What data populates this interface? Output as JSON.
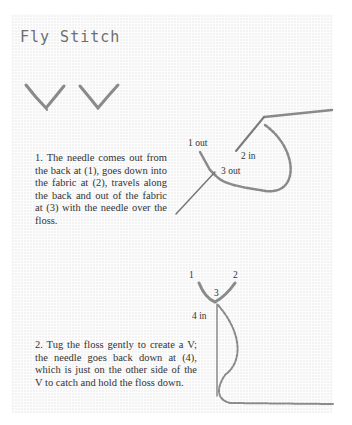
{
  "title": "Fly Stitch",
  "steps": [
    {
      "text": "1. The needle comes out from the back at (1), goes down into the fabric at (2), travels along the back and  out of the fabric at (3) with the needle over the floss.",
      "labels": {
        "one": "1 out",
        "two": "2 in",
        "three": "3 out"
      }
    },
    {
      "text": "2. Tug the floss gently to create a V; the needle goes back down at (4), which is just on the other side of the V to catch and hold the floss down.",
      "labels": {
        "one": "1",
        "two": "2",
        "three": "3",
        "four": "4 in"
      }
    }
  ],
  "colors": {
    "fabric": "#f3f3f3",
    "floss": "#8a8a8a",
    "needle": "#7a7a7a",
    "text": "#333333"
  }
}
